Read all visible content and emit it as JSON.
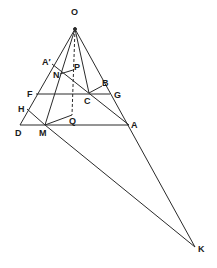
{
  "diagram": {
    "type": "geometric-construction",
    "line_color": "#2a2a2a",
    "label_color": "#1a1a1a",
    "points": {
      "O": {
        "x": 75,
        "y": 29,
        "label": "O",
        "lx": 71,
        "ly": 15
      },
      "A_prime": {
        "x": 52,
        "y": 64,
        "label": "A′",
        "lx": 42,
        "ly": 65
      },
      "N": {
        "x": 60,
        "y": 74,
        "label": "N",
        "lx": 53,
        "ly": 78
      },
      "P": {
        "x": 73,
        "y": 70,
        "label": "P",
        "lx": 74,
        "ly": 70
      },
      "F": {
        "x": 36,
        "y": 94,
        "label": "F",
        "lx": 27,
        "ly": 97
      },
      "C": {
        "x": 89,
        "y": 93,
        "label": "C",
        "lx": 84,
        "ly": 104
      },
      "B": {
        "x": 102,
        "y": 86,
        "label": "B",
        "lx": 102,
        "ly": 86
      },
      "G": {
        "x": 110,
        "y": 94,
        "label": "G",
        "lx": 114,
        "ly": 98
      },
      "H": {
        "x": 27,
        "y": 109,
        "label": "H",
        "lx": 18,
        "ly": 112
      },
      "D": {
        "x": 20,
        "y": 125,
        "label": "D",
        "lx": 15,
        "ly": 136
      },
      "M": {
        "x": 45,
        "y": 125,
        "label": "M",
        "lx": 39,
        "ly": 136
      },
      "Q": {
        "x": 72,
        "y": 115,
        "label": "Q",
        "lx": 69,
        "ly": 124
      },
      "A": {
        "x": 129,
        "y": 125,
        "label": "A",
        "lx": 131,
        "ly": 128
      },
      "K": {
        "x": 195,
        "y": 247,
        "label": "K",
        "lx": 198,
        "ly": 252
      }
    },
    "segments": [
      {
        "from": "O",
        "to": "D"
      },
      {
        "from": "O",
        "to": "K"
      },
      {
        "from": "O",
        "to": "M"
      },
      {
        "from": "O",
        "to": "C"
      },
      {
        "from": "D",
        "to": "A"
      },
      {
        "from": "F",
        "to": "G"
      },
      {
        "from": "A_prime",
        "to": "A"
      },
      {
        "from": "H",
        "to": "M"
      },
      {
        "from": "M",
        "to": "K"
      },
      {
        "from": "N",
        "to": "P"
      },
      {
        "from": "C",
        "to": "B"
      },
      {
        "from": "M",
        "to": "Q"
      }
    ],
    "dashed_segments": [
      {
        "from": "O",
        "to": "Q"
      }
    ]
  }
}
